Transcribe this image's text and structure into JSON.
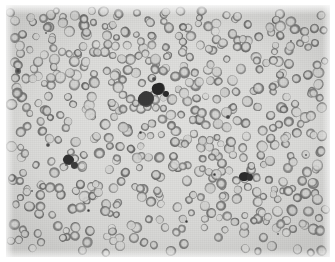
{
  "image": {
    "kind": "light-microscopy-photomicrograph",
    "subject": "peripheral blood smear",
    "modality": "brightfield",
    "color_mode": "grayscale",
    "caption": "",
    "title": "",
    "frame": {
      "page_background": "#ffffff",
      "field_left": 6,
      "field_top": 5,
      "field_width": 324,
      "field_height": 252
    },
    "palette": {
      "page": "#ffffff",
      "plasma_background": "#dcdcda",
      "plasma_light": "#e6e6e4",
      "plasma_dark": "#cfcfcd",
      "erythrocyte_rim": "#9a9a98",
      "erythrocyte_rim_dark": "#8a8a88",
      "erythrocyte_center": "#d4d4d2",
      "leukocyte_dark": "#2e2e2e",
      "leukocyte_mid": "#4a4a4a",
      "platelet_dark": "#3a3a3a"
    },
    "features": {
      "erythrocyte_count_rendered": 560,
      "erythrocyte_diameter_px": [
        7,
        11
      ],
      "leukocyte_clusters": 4,
      "platelet_specks": 14
    }
  },
  "cells": {
    "leukocytes": [
      {
        "name": "central-leukocyte-cluster-upper",
        "x": 152,
        "y": 84,
        "w": 13,
        "h": 12,
        "shade": "#262626",
        "rot": -20
      },
      {
        "name": "central-leukocyte-cluster-lower",
        "x": 140,
        "y": 94,
        "w": 16,
        "h": 16,
        "shade": "#3a3a3a",
        "rot": 15
      },
      {
        "name": "central-leukocyte-satellite",
        "x": 160,
        "y": 89,
        "w": 6,
        "h": 6,
        "shade": "#2b2b2b",
        "rot": 0
      },
      {
        "name": "left-leukocyte",
        "x": 62,
        "y": 155,
        "w": 11,
        "h": 10,
        "shade": "#303030",
        "rot": 30
      },
      {
        "name": "left-leukocyte-lobe",
        "x": 68,
        "y": 160,
        "w": 7,
        "h": 7,
        "shade": "#3d3d3d",
        "rot": 0
      },
      {
        "name": "right-leukocyte",
        "x": 238,
        "y": 171,
        "w": 11,
        "h": 9,
        "shade": "#2a2a2a",
        "rot": -10
      },
      {
        "name": "right-leukocyte-lobe",
        "x": 244,
        "y": 172,
        "w": 6,
        "h": 7,
        "shade": "#333333",
        "rot": 0
      }
    ],
    "platelets": [
      {
        "name": "platelet-left-upper",
        "x": 12,
        "y": 66,
        "r": 2.6
      },
      {
        "name": "platelet-left-mid",
        "x": 42,
        "y": 140,
        "r": 2.2
      },
      {
        "name": "platelet-center-upper",
        "x": 148,
        "y": 74,
        "r": 1.6
      },
      {
        "name": "platelet-center-mid",
        "x": 134,
        "y": 127,
        "r": 1.5
      },
      {
        "name": "platelet-center-low",
        "x": 60,
        "y": 160,
        "r": 1.4
      },
      {
        "name": "platelet-right-upper",
        "x": 222,
        "y": 112,
        "r": 1.6
      },
      {
        "name": "platelet-right-mid",
        "x": 208,
        "y": 169,
        "r": 1.5
      },
      {
        "name": "platelet-lower-center",
        "x": 180,
        "y": 216,
        "r": 1.5
      },
      {
        "name": "platelet-lower-left",
        "x": 82,
        "y": 205,
        "r": 1.5
      },
      {
        "name": "platelet-lower-right",
        "x": 272,
        "y": 229,
        "r": 1.4
      },
      {
        "name": "platelet-upper-right",
        "x": 285,
        "y": 36,
        "r": 1.4
      },
      {
        "name": "platelet-upper-left",
        "x": 40,
        "y": 28,
        "r": 1.3
      },
      {
        "name": "platelet-mid-right",
        "x": 300,
        "y": 150,
        "r": 1.3
      },
      {
        "name": "platelet-mid-left",
        "x": 26,
        "y": 186,
        "r": 1.3
      }
    ]
  }
}
